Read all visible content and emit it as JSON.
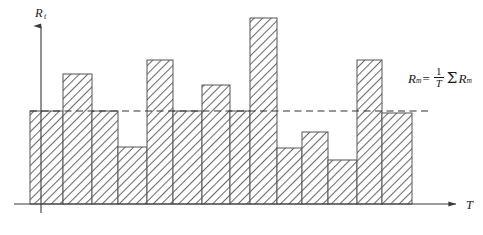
{
  "figure": {
    "y_axis_label": "R",
    "y_axis_label_subscript": "t",
    "x_axis_label": "T",
    "mean_line_style": "dashed",
    "bar_fill_pattern": "diagonal-hatch",
    "colors": {
      "axis": "#3a3a3a",
      "bar_outline": "#555555",
      "hatch": "#6b6b6b",
      "mean_line": "#333333",
      "text": "#1a1a1a",
      "background": "#ffffff"
    }
  },
  "annotation": {
    "formula_var": "R",
    "formula_var_sub": "m",
    "equals": "=",
    "fraction_numerator": "1",
    "fraction_denominator": "T",
    "sigma": "Σ",
    "sum_var": "R",
    "sum_var_sub": "m"
  },
  "chart_data": {
    "type": "bar",
    "title": "",
    "xlabel": "T",
    "ylabel": "R_t",
    "grid": false,
    "legend": null,
    "categories": [
      "1",
      "2",
      "3",
      "4",
      "5",
      "6",
      "7",
      "8",
      "9",
      "10",
      "11",
      "12",
      "13",
      "14"
    ],
    "values": [
      93,
      130,
      93,
      57,
      144,
      93,
      119,
      93,
      186,
      56,
      72,
      44,
      144,
      91
    ],
    "ylim": [
      0,
      200
    ],
    "bar_edges_px": [
      30,
      63,
      92,
      118,
      147,
      173,
      202,
      230,
      250,
      277,
      302,
      328,
      357,
      382,
      412
    ],
    "baseline_px": 204,
    "mean_value": 93,
    "mean_line_px": 111,
    "annotations": [
      "R_m = (1/T) Σ R_m"
    ]
  }
}
